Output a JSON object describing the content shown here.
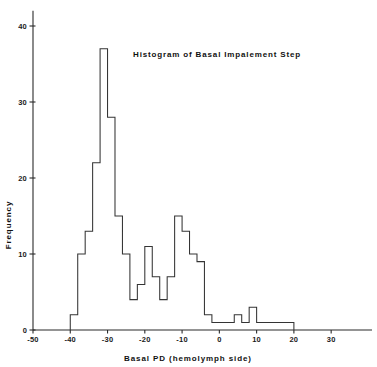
{
  "chart_data": {
    "type": "bar",
    "title": "Histogram of Basal Impalement Step",
    "xlabel": "Basal PD (hemolymph side)",
    "ylabel": "Frequency",
    "xlim": [
      -50,
      35
    ],
    "ylim": [
      0,
      42
    ],
    "grid": false,
    "legend": null,
    "bin_width": 2,
    "bin_edges": [
      -40,
      -38,
      -36,
      -34,
      -32,
      -30,
      -28,
      -26,
      -24,
      -22,
      -20,
      -18,
      -16,
      -14,
      -12,
      -10,
      -8,
      -6,
      -4,
      -2,
      0,
      2,
      4,
      6,
      8,
      10,
      12,
      14,
      16,
      18,
      20
    ],
    "values": [
      2,
      10,
      13,
      22,
      37,
      28,
      15,
      10,
      4,
      6,
      11,
      7,
      4,
      7,
      15,
      13,
      10,
      9,
      2,
      1,
      1,
      1,
      2,
      1,
      3,
      1,
      1,
      1,
      1,
      1
    ],
    "categories": [
      "-40 to -38",
      "-38 to -36",
      "-36 to -34",
      "-34 to -32",
      "-32 to -30",
      "-30 to -28",
      "-28 to -26",
      "-26 to -24",
      "-24 to -22",
      "-22 to -20",
      "-20 to -18",
      "-18 to -16",
      "-16 to -14",
      "-14 to -12",
      "-12 to -10",
      "-10 to -8",
      "-8 to -6",
      "-6 to -4",
      "-4 to -2",
      "-2 to 0",
      "0 to 2",
      "2 to 4",
      "4 to 6",
      "6 to 8",
      "8 to 10",
      "10 to 12",
      "12 to 14",
      "14 to 16",
      "16 to 18",
      "18 to 20"
    ],
    "xticks": [
      -50,
      -40,
      -30,
      -20,
      -10,
      0,
      10,
      20,
      30
    ],
    "xtick_labels": [
      "-50",
      "-40",
      "-30",
      "-20",
      "-10",
      "0",
      "10",
      "20",
      "30"
    ],
    "yticks": [
      0,
      10,
      20,
      30,
      40
    ],
    "ytick_labels": [
      "0",
      "10",
      "20",
      "30",
      "40"
    ],
    "peak_value": 37,
    "peak_bin": "-32 to -30",
    "line_color": "#343434",
    "axis_color": "#2b2b2b",
    "background": "#ffffff"
  }
}
